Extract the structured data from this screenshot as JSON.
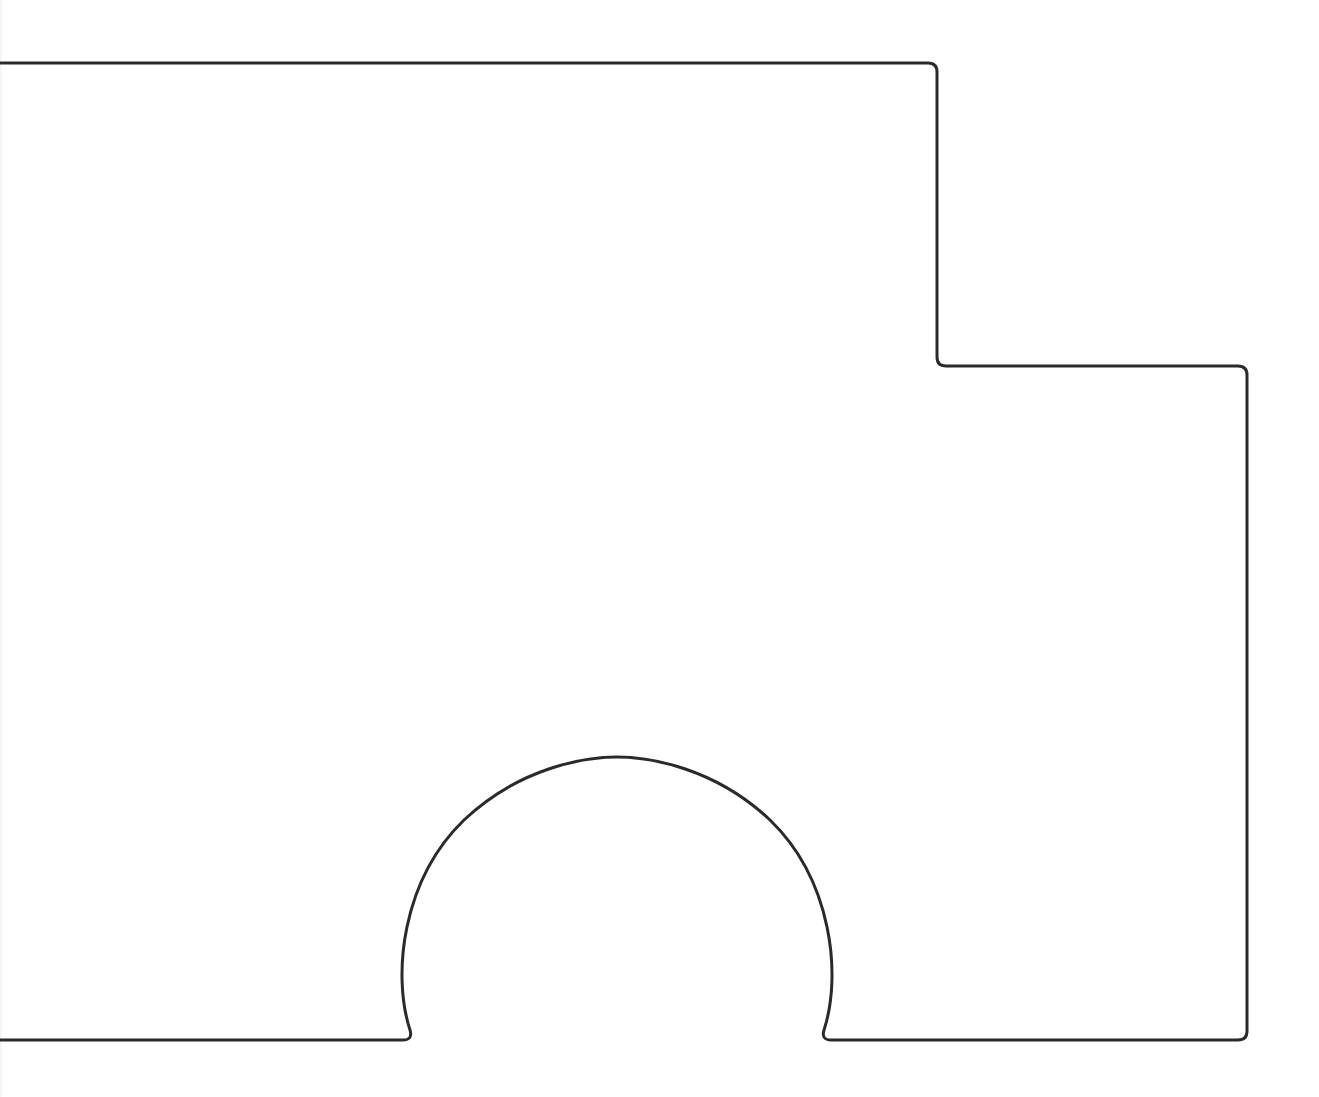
{
  "diagram": {
    "type": "outline-shape",
    "stroke_color": "#2a2a2a",
    "background_color": "#ffffff",
    "stroke_width": 3,
    "path": "M 0 63 L 928 63 Q 937 63 937 72 L 937 357 Q 937 366 946 366 L 1238 366 Q 1247 366 1247 375 L 1247 1031 Q 1247 1040 1238 1040 L 831 1040 Q 821 1040 824 1030 C 842 975 832 880 770 820 C 715 768 650 757 617 757 C 584 757 519 768 464 820 C 402 880 392 975 410 1030 Q 413 1040 403 1040 L 0 1040",
    "segments": [
      {
        "name": "top-edge",
        "from": [
          0,
          63
        ],
        "to": [
          928,
          63
        ]
      },
      {
        "name": "upper-right-edge",
        "from": [
          937,
          72
        ],
        "to": [
          937,
          357
        ]
      },
      {
        "name": "step-edge",
        "from": [
          946,
          366
        ],
        "to": [
          1238,
          366
        ]
      },
      {
        "name": "right-edge",
        "from": [
          1247,
          375
        ],
        "to": [
          1247,
          1031
        ]
      },
      {
        "name": "bottom-right-edge",
        "from": [
          1238,
          1040
        ],
        "to": [
          831,
          1040
        ]
      },
      {
        "name": "arch",
        "from": [
          824,
          1030
        ],
        "apex": [
          617,
          757
        ],
        "to": [
          410,
          1030
        ]
      },
      {
        "name": "bottom-left-edge",
        "from": [
          403,
          1040
        ],
        "to": [
          0,
          1040
        ]
      }
    ]
  }
}
